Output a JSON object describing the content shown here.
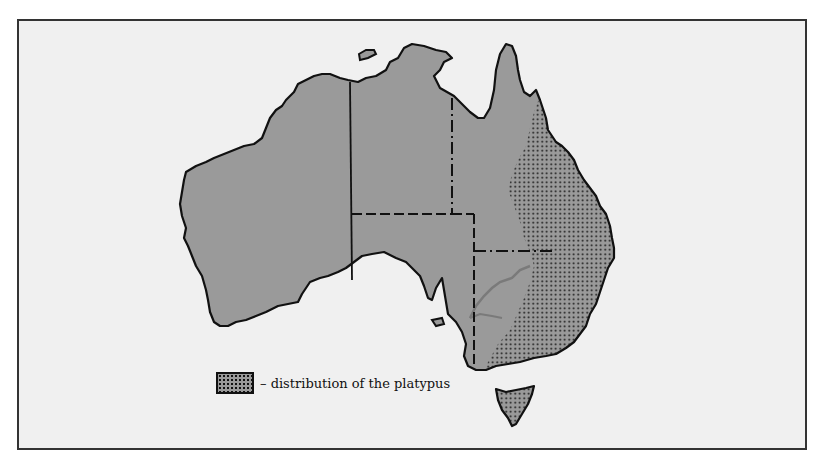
{
  "map": {
    "subject": "Australia",
    "land_color": "#9a9a9a",
    "background_color": "#f0f0f0",
    "outline_color": "#111111",
    "range_pattern": "dotted",
    "highlighted_region": "eastern Australia and Tasmania",
    "river_color": "#7a7a7a"
  },
  "legend": {
    "label": "– distribution of the platypus"
  }
}
